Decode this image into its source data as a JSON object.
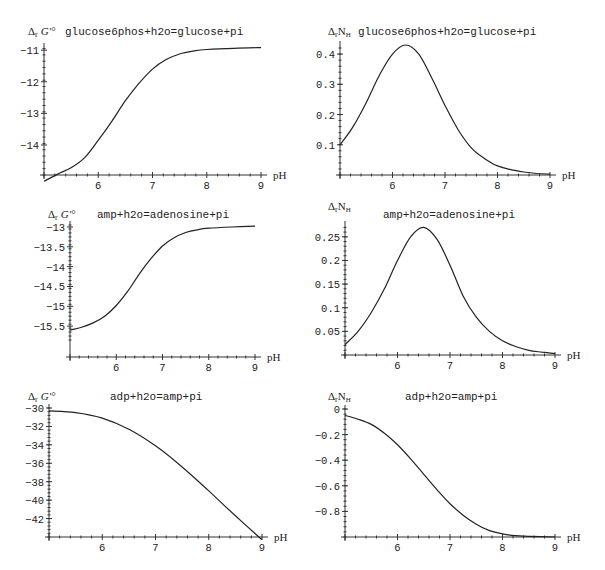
{
  "chart_data": [
    {
      "type": "line",
      "title": "glucose6phos+h2o=glucose+pi",
      "ylabel": "ΔrG'°",
      "xlabel": "pH",
      "x_ticks": [
        6,
        7,
        8,
        9
      ],
      "y_ticks": [
        -11,
        -12,
        -13,
        -14
      ],
      "xlim": [
        5,
        9
      ],
      "ylim": [
        -14.95,
        -10.9
      ],
      "grid": false,
      "series": [
        {
          "name": "ΔrG'°",
          "x": [
            5.0,
            5.25,
            5.5,
            5.75,
            6.0,
            6.25,
            6.5,
            6.75,
            7.0,
            7.25,
            7.5,
            7.75,
            8.0,
            8.5,
            9.0
          ],
          "y": [
            -15.15,
            -14.92,
            -14.72,
            -14.4,
            -13.85,
            -13.25,
            -12.6,
            -12.05,
            -11.6,
            -11.3,
            -11.12,
            -11.03,
            -10.98,
            -10.94,
            -10.92
          ]
        }
      ]
    },
    {
      "type": "line",
      "title": "glucose6phos+h2o=glucose+pi",
      "ylabel": "ΔrNH",
      "xlabel": "pH",
      "x_ticks": [
        6,
        7,
        8,
        9
      ],
      "y_ticks": [
        0.1,
        0.2,
        0.3,
        0.4
      ],
      "xlim": [
        5,
        9
      ],
      "ylim": [
        0,
        0.43
      ],
      "grid": false,
      "series": [
        {
          "name": "ΔrNH",
          "x": [
            5.0,
            5.25,
            5.5,
            5.75,
            6.0,
            6.25,
            6.5,
            6.75,
            7.0,
            7.25,
            7.5,
            7.75,
            8.0,
            8.25,
            8.5,
            8.75,
            9.0
          ],
          "y": [
            0.1,
            0.16,
            0.24,
            0.33,
            0.4,
            0.43,
            0.4,
            0.32,
            0.23,
            0.15,
            0.09,
            0.055,
            0.03,
            0.018,
            0.01,
            0.005,
            0.003
          ]
        }
      ]
    },
    {
      "type": "line",
      "title": "amp+h2o=adenosine+pi",
      "ylabel": "ΔrG'°",
      "xlabel": "pH",
      "x_ticks": [
        6,
        7,
        8,
        9
      ],
      "y_ticks": [
        -13,
        -13.5,
        -14,
        -14.5,
        -15,
        -15.5
      ],
      "xlim": [
        5,
        9
      ],
      "ylim": [
        -15.85,
        -12.95
      ],
      "grid": false,
      "series": [
        {
          "name": "ΔrG'°",
          "x": [
            5.0,
            5.25,
            5.5,
            5.75,
            6.0,
            6.25,
            6.5,
            6.75,
            7.0,
            7.25,
            7.5,
            7.75,
            8.0,
            8.5,
            9.0
          ],
          "y": [
            -15.6,
            -15.53,
            -15.42,
            -15.25,
            -14.98,
            -14.62,
            -14.18,
            -13.8,
            -13.48,
            -13.27,
            -13.14,
            -13.07,
            -13.03,
            -13.0,
            -12.98
          ]
        }
      ]
    },
    {
      "type": "line",
      "title": "amp+h2o=adenosine+pi",
      "ylabel": "ΔrNH",
      "xlabel": "pH",
      "x_ticks": [
        6,
        7,
        8,
        9
      ],
      "y_ticks": [
        0.05,
        0.1,
        0.15,
        0.2,
        0.25
      ],
      "xlim": [
        5,
        9
      ],
      "ylim": [
        0,
        0.275
      ],
      "grid": false,
      "series": [
        {
          "name": "ΔrNH",
          "x": [
            5.0,
            5.25,
            5.5,
            5.75,
            6.0,
            6.25,
            6.5,
            6.75,
            7.0,
            7.25,
            7.5,
            7.75,
            8.0,
            8.25,
            8.5,
            8.75,
            9.0
          ],
          "y": [
            0.022,
            0.05,
            0.09,
            0.14,
            0.2,
            0.25,
            0.27,
            0.245,
            0.19,
            0.125,
            0.08,
            0.05,
            0.03,
            0.018,
            0.01,
            0.006,
            0.003
          ]
        }
      ]
    },
    {
      "type": "line",
      "title": "adp+h2o=amp+pi",
      "ylabel": "ΔrG'°",
      "xlabel": "pH",
      "x_ticks": [
        6,
        7,
        8,
        9
      ],
      "y_ticks": [
        -30,
        -32,
        -34,
        -36,
        -38,
        -40,
        -42
      ],
      "xlim": [
        5,
        9
      ],
      "ylim": [
        -44,
        -30
      ],
      "grid": false,
      "series": [
        {
          "name": "ΔrG'°",
          "x": [
            5.0,
            5.5,
            6.0,
            6.5,
            7.0,
            7.5,
            8.0,
            8.5,
            9.0
          ],
          "y": [
            -30.3,
            -30.5,
            -31.1,
            -32.3,
            -34.1,
            -36.4,
            -39.0,
            -41.7,
            -44.3
          ]
        }
      ]
    },
    {
      "type": "line",
      "title": "adp+h2o=amp+pi",
      "ylabel": "ΔrNH",
      "xlabel": "pH",
      "x_ticks": [
        6,
        7,
        8,
        9
      ],
      "y_ticks": [
        0,
        -0.2,
        -0.4,
        -0.6,
        -0.8
      ],
      "xlim": [
        5,
        9
      ],
      "ylim": [
        -1.0,
        0
      ],
      "grid": false,
      "series": [
        {
          "name": "ΔrNH",
          "x": [
            5.0,
            5.25,
            5.5,
            5.75,
            6.0,
            6.25,
            6.5,
            6.75,
            7.0,
            7.25,
            7.5,
            7.75,
            8.0,
            8.25,
            8.5,
            9.0
          ],
          "y": [
            -0.05,
            -0.08,
            -0.12,
            -0.19,
            -0.28,
            -0.39,
            -0.51,
            -0.63,
            -0.74,
            -0.83,
            -0.9,
            -0.95,
            -0.975,
            -0.99,
            -0.995,
            -1.0
          ]
        }
      ]
    }
  ],
  "panels_layout": [
    {
      "x0": 44,
      "x1": 261,
      "ytop": 47,
      "ybot": 175,
      "xaxis_y": 175,
      "yaxis_x": 44,
      "title_x": 65,
      "title_y": 35,
      "ylab_x": 28,
      "ylab_y": 35
    },
    {
      "x0": 340,
      "x1": 550,
      "ytop": 45,
      "ybot": 175,
      "xaxis_y": 175,
      "yaxis_x": 340,
      "title_x": 358,
      "title_y": 35,
      "ylab_x": 328,
      "ylab_y": 35
    },
    {
      "x0": 70,
      "x1": 255,
      "ytop": 225,
      "ybot": 340,
      "xaxis_y": 357,
      "yaxis_x": 70,
      "title_x": 97,
      "title_y": 218,
      "ylab_x": 48,
      "ylab_y": 218
    },
    {
      "x0": 345,
      "x1": 555,
      "ytop": 225,
      "ybot": 355,
      "xaxis_y": 355,
      "yaxis_x": 345,
      "title_x": 383,
      "title_y": 218,
      "ylab_x": 328,
      "ylab_y": 210
    },
    {
      "x0": 49,
      "x1": 262,
      "ytop": 408,
      "ybot": 537,
      "xaxis_y": 537,
      "yaxis_x": 49,
      "title_x": 110,
      "title_y": 400,
      "ylab_x": 28,
      "ylab_y": 400
    },
    {
      "x0": 345,
      "x1": 555,
      "ytop": 409,
      "ybot": 537,
      "xaxis_y": 537,
      "yaxis_x": 345,
      "title_x": 405,
      "title_y": 400,
      "ylab_x": 328,
      "ylab_y": 400
    }
  ]
}
